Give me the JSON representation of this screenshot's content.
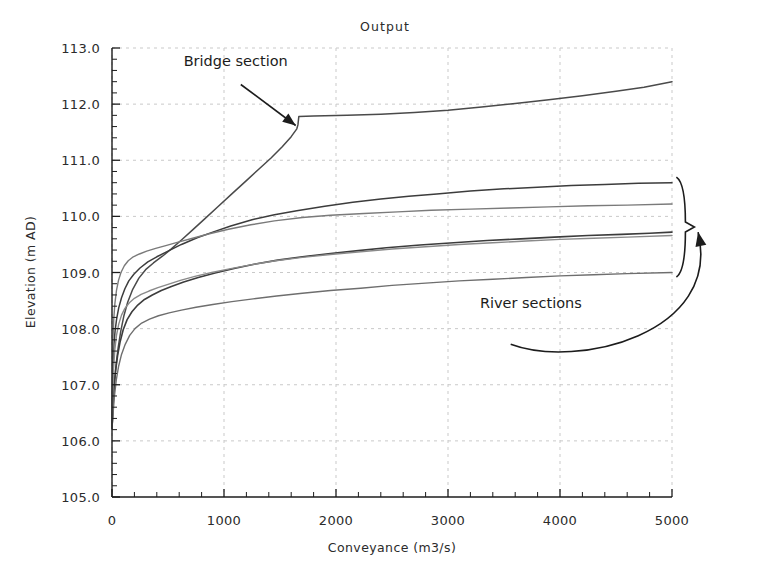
{
  "chart_data": {
    "type": "line",
    "title": "Output",
    "xlabel": "Conveyance (m3/s)",
    "ylabel": "Elevation (m AD)",
    "xlim": [
      0,
      5000
    ],
    "ylim": [
      105.0,
      113.0
    ],
    "grid": true,
    "legend_position": "none",
    "xticks": [
      0,
      1000,
      2000,
      3000,
      4000,
      5000
    ],
    "xtick_labels": [
      "0",
      "1000",
      "2000",
      "3000",
      "4000",
      "5000"
    ],
    "x_minor_tick_step": 200,
    "yticks": [
      105.0,
      106.0,
      107.0,
      108.0,
      109.0,
      110.0,
      111.0,
      112.0,
      113.0
    ],
    "ytick_labels": [
      "105.0",
      "106.0",
      "107.0",
      "108.0",
      "109.0",
      "110.0",
      "111.0",
      "112.0",
      "113.0"
    ],
    "y_minor_tick_step": 0.2,
    "annotations": [
      {
        "name": "bridge-section",
        "text": "Bridge section",
        "text_x": 640,
        "text_y": 112.68,
        "arrow_from_x": 1150,
        "arrow_from_y": 112.35,
        "arrow_to_x": 1640,
        "arrow_to_y": 111.62
      },
      {
        "name": "river-sections",
        "text": "River sections",
        "text_x": 3740,
        "text_y": 108.37,
        "brace_x": 5120,
        "brace_y_top": 110.7,
        "brace_y_bottom": 108.92,
        "arrow_to_x": 5090,
        "arrow_to_y": 109.72
      }
    ],
    "series": [
      {
        "name": "Bridge section",
        "color": "#4a4a4a",
        "width": 1.5,
        "points": [
          [
            0,
            106.22
          ],
          [
            6,
            106.45
          ],
          [
            14,
            106.78
          ],
          [
            24,
            107.08
          ],
          [
            38,
            107.38
          ],
          [
            55,
            107.66
          ],
          [
            78,
            107.95
          ],
          [
            105,
            108.22
          ],
          [
            140,
            108.47
          ],
          [
            185,
            108.7
          ],
          [
            240,
            108.9
          ],
          [
            300,
            109.05
          ],
          [
            370,
            109.17
          ],
          [
            450,
            109.29
          ],
          [
            530,
            109.42
          ],
          [
            620,
            109.58
          ],
          [
            720,
            109.76
          ],
          [
            830,
            109.96
          ],
          [
            950,
            110.18
          ],
          [
            1070,
            110.4
          ],
          [
            1190,
            110.62
          ],
          [
            1310,
            110.84
          ],
          [
            1420,
            111.04
          ],
          [
            1520,
            111.24
          ],
          [
            1600,
            111.42
          ],
          [
            1650,
            111.56
          ],
          [
            1660,
            111.63
          ],
          [
            1668,
            111.78
          ],
          [
            1800,
            111.79
          ],
          [
            2100,
            111.8
          ],
          [
            2400,
            111.82
          ],
          [
            2700,
            111.85
          ],
          [
            3000,
            111.89
          ],
          [
            3300,
            111.95
          ],
          [
            3600,
            112.01
          ],
          [
            3900,
            112.08
          ],
          [
            4200,
            112.15
          ],
          [
            4500,
            112.23
          ],
          [
            4750,
            112.3
          ],
          [
            5000,
            112.4
          ]
        ]
      },
      {
        "name": "River section 1",
        "color": "#3c3c3c",
        "width": 1.5,
        "points": [
          [
            0,
            106.22
          ],
          [
            5,
            106.95
          ],
          [
            10,
            107.42
          ],
          [
            18,
            107.74
          ],
          [
            28,
            107.97
          ],
          [
            42,
            108.18
          ],
          [
            60,
            108.37
          ],
          [
            85,
            108.55
          ],
          [
            115,
            108.71
          ],
          [
            150,
            108.85
          ],
          [
            195,
            108.97
          ],
          [
            250,
            109.08
          ],
          [
            320,
            109.19
          ],
          [
            400,
            109.28
          ],
          [
            500,
            109.38
          ],
          [
            620,
            109.5
          ],
          [
            760,
            109.62
          ],
          [
            900,
            109.72
          ],
          [
            1060,
            109.83
          ],
          [
            1250,
            109.94
          ],
          [
            1450,
            110.03
          ],
          [
            1650,
            110.1
          ],
          [
            1900,
            110.18
          ],
          [
            2150,
            110.25
          ],
          [
            2400,
            110.31
          ],
          [
            2650,
            110.36
          ],
          [
            2900,
            110.4
          ],
          [
            3200,
            110.45
          ],
          [
            3500,
            110.49
          ],
          [
            3800,
            110.52
          ],
          [
            4100,
            110.55
          ],
          [
            4400,
            110.57
          ],
          [
            4700,
            110.59
          ],
          [
            5000,
            110.6
          ]
        ]
      },
      {
        "name": "River section 2",
        "color": "#7a7a7a",
        "width": 1.4,
        "points": [
          [
            0,
            106.22
          ],
          [
            4,
            107.2
          ],
          [
            9,
            107.8
          ],
          [
            16,
            108.18
          ],
          [
            26,
            108.45
          ],
          [
            40,
            108.68
          ],
          [
            58,
            108.86
          ],
          [
            80,
            109.0
          ],
          [
            110,
            109.12
          ],
          [
            145,
            109.21
          ],
          [
            190,
            109.28
          ],
          [
            245,
            109.33
          ],
          [
            310,
            109.38
          ],
          [
            390,
            109.43
          ],
          [
            480,
            109.48
          ],
          [
            590,
            109.54
          ],
          [
            720,
            109.61
          ],
          [
            870,
            109.69
          ],
          [
            1040,
            109.77
          ],
          [
            1240,
            109.85
          ],
          [
            1450,
            109.92
          ],
          [
            1700,
            109.98
          ],
          [
            1950,
            110.02
          ],
          [
            2250,
            110.05
          ],
          [
            2550,
            110.08
          ],
          [
            2850,
            110.11
          ],
          [
            3200,
            110.13
          ],
          [
            3550,
            110.15
          ],
          [
            3900,
            110.17
          ],
          [
            4250,
            110.19
          ],
          [
            4600,
            110.2
          ],
          [
            5000,
            110.22
          ]
        ]
      },
      {
        "name": "River section 3",
        "color": "#3c3c3c",
        "width": 1.6,
        "points": [
          [
            0,
            106.22
          ],
          [
            8,
            106.6
          ],
          [
            18,
            106.95
          ],
          [
            32,
            107.25
          ],
          [
            50,
            107.52
          ],
          [
            72,
            107.76
          ],
          [
            100,
            107.98
          ],
          [
            135,
            108.16
          ],
          [
            178,
            108.3
          ],
          [
            230,
            108.42
          ],
          [
            290,
            108.52
          ],
          [
            360,
            108.6
          ],
          [
            440,
            108.68
          ],
          [
            530,
            108.75
          ],
          [
            640,
            108.83
          ],
          [
            770,
            108.91
          ],
          [
            920,
            108.99
          ],
          [
            1090,
            109.07
          ],
          [
            1280,
            109.15
          ],
          [
            1480,
            109.22
          ],
          [
            1700,
            109.28
          ],
          [
            1950,
            109.34
          ],
          [
            2200,
            109.39
          ],
          [
            2450,
            109.44
          ],
          [
            2750,
            109.49
          ],
          [
            3050,
            109.53
          ],
          [
            3350,
            109.57
          ],
          [
            3650,
            109.6
          ],
          [
            3950,
            109.63
          ],
          [
            4250,
            109.66
          ],
          [
            4550,
            109.68
          ],
          [
            4800,
            109.7
          ],
          [
            5000,
            109.72
          ]
        ]
      },
      {
        "name": "River section 4",
        "color": "#8a8a8a",
        "width": 1.4,
        "points": [
          [
            0,
            106.22
          ],
          [
            6,
            106.82
          ],
          [
            14,
            107.28
          ],
          [
            25,
            107.62
          ],
          [
            40,
            107.88
          ],
          [
            60,
            108.08
          ],
          [
            85,
            108.24
          ],
          [
            115,
            108.36
          ],
          [
            155,
            108.46
          ],
          [
            200,
            108.54
          ],
          [
            260,
            108.61
          ],
          [
            330,
            108.67
          ],
          [
            410,
            108.73
          ],
          [
            500,
            108.79
          ],
          [
            610,
            108.86
          ],
          [
            740,
            108.93
          ],
          [
            890,
            109.0
          ],
          [
            1060,
            109.07
          ],
          [
            1250,
            109.14
          ],
          [
            1460,
            109.21
          ],
          [
            1700,
            109.27
          ],
          [
            1950,
            109.32
          ],
          [
            2220,
            109.37
          ],
          [
            2500,
            109.42
          ],
          [
            2800,
            109.46
          ],
          [
            3100,
            109.5
          ],
          [
            3400,
            109.53
          ],
          [
            3700,
            109.56
          ],
          [
            4000,
            109.59
          ],
          [
            4300,
            109.61
          ],
          [
            4600,
            109.63
          ],
          [
            5000,
            109.66
          ]
        ]
      },
      {
        "name": "River section 5",
        "color": "#6e6e6e",
        "width": 1.4,
        "points": [
          [
            0,
            106.22
          ],
          [
            10,
            106.5
          ],
          [
            22,
            106.8
          ],
          [
            38,
            107.08
          ],
          [
            58,
            107.32
          ],
          [
            85,
            107.54
          ],
          [
            118,
            107.72
          ],
          [
            158,
            107.88
          ],
          [
            205,
            108.0
          ],
          [
            265,
            108.1
          ],
          [
            335,
            108.17
          ],
          [
            415,
            108.23
          ],
          [
            510,
            108.28
          ],
          [
            620,
            108.33
          ],
          [
            750,
            108.38
          ],
          [
            900,
            108.43
          ],
          [
            1070,
            108.48
          ],
          [
            1260,
            108.53
          ],
          [
            1470,
            108.58
          ],
          [
            1700,
            108.63
          ],
          [
            1950,
            108.68
          ],
          [
            2220,
            108.72
          ],
          [
            2500,
            108.77
          ],
          [
            2800,
            108.81
          ],
          [
            3100,
            108.85
          ],
          [
            3400,
            108.88
          ],
          [
            3700,
            108.91
          ],
          [
            4000,
            108.94
          ],
          [
            4300,
            108.96
          ],
          [
            4600,
            108.98
          ],
          [
            5000,
            109.0
          ]
        ]
      }
    ]
  }
}
